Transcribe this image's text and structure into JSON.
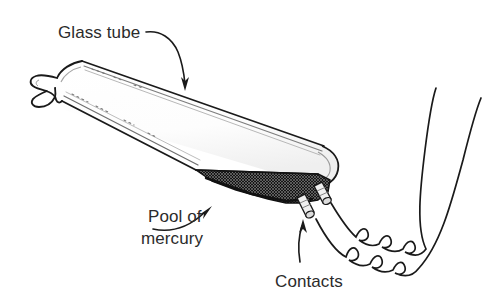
{
  "figure": {
    "background_color": "#ffffff",
    "ink_color": "#1a1a1a",
    "text_color": "#2b2b2b",
    "mercury_color": "#1c1c1c"
  },
  "labels": {
    "glass_tube": "Glass tube",
    "pool_of": "Pool of",
    "mercury": "mercury",
    "contacts": "Contacts"
  },
  "parts": [
    {
      "name": "glass-tube",
      "label": "Glass tube"
    },
    {
      "name": "mercury-pool",
      "label": "Pool of mercury"
    },
    {
      "name": "contacts",
      "label": "Contacts"
    },
    {
      "name": "lead-wires",
      "label": ""
    }
  ]
}
